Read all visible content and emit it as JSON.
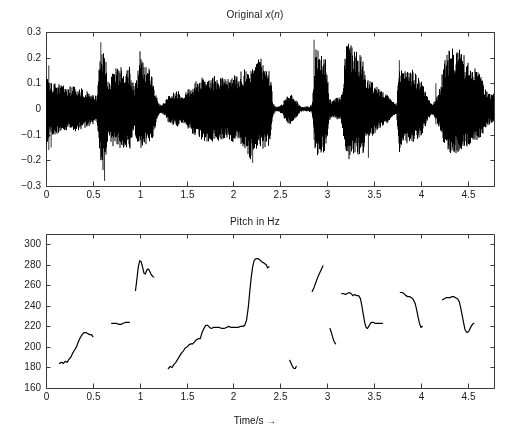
{
  "figure": {
    "width": 510,
    "height": 435,
    "background": "#ffffff",
    "line_color": "#000000",
    "axis_color": "#3a3a3a",
    "font_size_px": 10
  },
  "top_panel": {
    "title": "Original x(n)",
    "title_parts": {
      "prefix": "Original ",
      "italic_x": "x",
      "paren_open": "(",
      "italic_n": "n",
      "paren_close": ")"
    },
    "plot_box": {
      "left": 46,
      "top": 32,
      "right": 494,
      "bottom": 186
    },
    "ylabel": "",
    "xlabel": ""
  },
  "bottom_panel": {
    "title": "Pitch in Hz",
    "xlabel": "Time/s →",
    "plot_box": {
      "left": 46,
      "top": 234,
      "right": 494,
      "bottom": 388
    },
    "ylabel": ""
  },
  "chart_data": [
    {
      "type": "area",
      "title": "Original x(n)",
      "xlabel": "",
      "ylabel": "",
      "xlim": [
        0,
        4.78
      ],
      "ylim": [
        -0.3,
        0.3
      ],
      "xticks": [
        0,
        0.5,
        1,
        1.5,
        2,
        2.5,
        3,
        3.5,
        4,
        4.5
      ],
      "xticklabels": [
        "0",
        "0.5",
        "1",
        "1.5",
        "2",
        "2.5",
        "3",
        "3.5",
        "4",
        "4.5"
      ],
      "yticks": [
        -0.3,
        -0.2,
        -0.1,
        0,
        0.1,
        0.2,
        0.3
      ],
      "yticklabels": [
        "-0.3",
        "-0.2",
        "-0.1",
        "0",
        "0.1",
        "0.2",
        "0.3"
      ],
      "grid": false,
      "legend": "none",
      "description": "Speech waveform amplitude vs time, plotted as dense oscillation filled between positive and negative envelope.",
      "envelope": {
        "comment": "Piecewise envelope of |x(n)| sampled at time t (s); pos = upper bound, neg = lower bound.",
        "t": [
          0.0,
          0.02,
          0.04,
          0.06,
          0.1,
          0.15,
          0.2,
          0.26,
          0.32,
          0.38,
          0.44,
          0.5,
          0.54,
          0.56,
          0.58,
          0.6,
          0.62,
          0.64,
          0.66,
          0.68,
          0.7,
          0.74,
          0.78,
          0.82,
          0.86,
          0.9,
          0.94,
          0.97,
          1.0,
          1.03,
          1.06,
          1.1,
          1.14,
          1.18,
          1.21,
          1.24,
          1.27,
          1.3,
          1.34,
          1.38,
          1.42,
          1.46,
          1.5,
          1.55,
          1.6,
          1.65,
          1.7,
          1.75,
          1.8,
          1.85,
          1.9,
          1.95,
          2.0,
          2.05,
          2.1,
          2.14,
          2.18,
          2.2,
          2.22,
          2.25,
          2.28,
          2.31,
          2.34,
          2.37,
          2.4,
          2.42,
          2.45,
          2.48,
          2.52,
          2.56,
          2.6,
          2.64,
          2.68,
          2.72,
          2.76,
          2.8,
          2.84,
          2.86,
          2.88,
          2.9,
          2.93,
          2.96,
          2.99,
          3.02,
          3.05,
          3.08,
          3.11,
          3.14,
          3.17,
          3.2,
          3.23,
          3.26,
          3.29,
          3.32,
          3.35,
          3.38,
          3.41,
          3.44,
          3.47,
          3.5,
          3.54,
          3.58,
          3.62,
          3.66,
          3.7,
          3.74,
          3.77,
          3.8,
          3.84,
          3.88,
          3.92,
          3.96,
          4.0,
          4.04,
          4.08,
          4.12,
          4.16,
          4.2,
          4.24,
          4.28,
          4.32,
          4.36,
          4.4,
          4.44,
          4.48,
          4.52,
          4.56,
          4.6,
          4.64,
          4.68,
          4.72,
          4.76
        ],
        "pos": [
          0.16,
          0.12,
          0.11,
          0.1,
          0.1,
          0.1,
          0.09,
          0.09,
          0.09,
          0.08,
          0.07,
          0.06,
          0.05,
          0.12,
          0.25,
          0.22,
          0.24,
          0.2,
          0.13,
          0.1,
          0.15,
          0.16,
          0.16,
          0.17,
          0.16,
          0.17,
          0.09,
          0.12,
          0.23,
          0.21,
          0.17,
          0.17,
          0.11,
          0.05,
          0.02,
          0.02,
          0.03,
          0.05,
          0.06,
          0.07,
          0.07,
          0.06,
          0.07,
          0.09,
          0.11,
          0.12,
          0.13,
          0.13,
          0.13,
          0.13,
          0.12,
          0.12,
          0.13,
          0.14,
          0.15,
          0.16,
          0.16,
          0.15,
          0.18,
          0.19,
          0.21,
          0.2,
          0.19,
          0.17,
          0.13,
          0.03,
          0.01,
          0.01,
          0.02,
          0.05,
          0.06,
          0.05,
          0.03,
          0.01,
          0.01,
          0.01,
          0.02,
          0.12,
          0.26,
          0.25,
          0.25,
          0.24,
          0.22,
          0.05,
          0.03,
          0.04,
          0.05,
          0.04,
          0.11,
          0.26,
          0.28,
          0.25,
          0.24,
          0.24,
          0.22,
          0.2,
          0.14,
          0.12,
          0.11,
          0.1,
          0.09,
          0.07,
          0.06,
          0.05,
          0.03,
          0.02,
          0.17,
          0.16,
          0.17,
          0.17,
          0.15,
          0.13,
          0.12,
          0.08,
          0.04,
          0.02,
          0.04,
          0.08,
          0.17,
          0.22,
          0.24,
          0.23,
          0.25,
          0.22,
          0.2,
          0.18,
          0.15,
          0.17,
          0.13,
          0.09,
          0.06,
          0.06
        ],
        "neg": [
          -0.16,
          -0.12,
          -0.11,
          -0.1,
          -0.1,
          -0.1,
          -0.09,
          -0.09,
          -0.09,
          -0.08,
          -0.07,
          -0.06,
          -0.05,
          -0.12,
          -0.21,
          -0.25,
          -0.22,
          -0.2,
          -0.13,
          -0.1,
          -0.15,
          -0.15,
          -0.15,
          -0.16,
          -0.16,
          -0.16,
          -0.09,
          -0.12,
          -0.16,
          -0.15,
          -0.14,
          -0.14,
          -0.11,
          -0.05,
          -0.02,
          -0.02,
          -0.03,
          -0.05,
          -0.06,
          -0.07,
          -0.07,
          -0.06,
          -0.07,
          -0.09,
          -0.11,
          -0.12,
          -0.13,
          -0.13,
          -0.13,
          -0.13,
          -0.12,
          -0.12,
          -0.13,
          -0.14,
          -0.15,
          -0.16,
          -0.21,
          -0.15,
          -0.17,
          -0.16,
          -0.16,
          -0.16,
          -0.16,
          -0.15,
          -0.12,
          -0.03,
          -0.01,
          -0.01,
          -0.02,
          -0.05,
          -0.06,
          -0.05,
          -0.03,
          -0.01,
          -0.01,
          -0.01,
          -0.02,
          -0.12,
          -0.2,
          -0.19,
          -0.18,
          -0.17,
          -0.16,
          -0.05,
          -0.03,
          -0.04,
          -0.05,
          -0.04,
          -0.11,
          -0.18,
          -0.2,
          -0.19,
          -0.19,
          -0.18,
          -0.19,
          -0.2,
          -0.14,
          -0.12,
          -0.11,
          -0.1,
          -0.09,
          -0.07,
          -0.06,
          -0.05,
          -0.03,
          -0.02,
          -0.17,
          -0.14,
          -0.14,
          -0.14,
          -0.13,
          -0.12,
          -0.11,
          -0.08,
          -0.04,
          -0.02,
          -0.04,
          -0.08,
          -0.14,
          -0.17,
          -0.18,
          -0.17,
          -0.18,
          -0.16,
          -0.15,
          -0.14,
          -0.12,
          -0.13,
          -0.11,
          -0.09,
          -0.06,
          -0.06
        ]
      },
      "spikes": [
        {
          "t": 0.03,
          "pos": 0.17,
          "neg": -0.16
        },
        {
          "t": 0.055,
          "pos": 0.05,
          "neg": -0.15
        },
        {
          "t": 0.585,
          "pos": 0.26,
          "neg": -0.2
        },
        {
          "t": 0.625,
          "pos": 0.12,
          "neg": -0.28
        },
        {
          "t": 2.205,
          "pos": 0.1,
          "neg": -0.21
        },
        {
          "t": 2.86,
          "pos": 0.27,
          "neg": -0.12
        },
        {
          "t": 3.44,
          "pos": 0.08,
          "neg": -0.19
        },
        {
          "t": 3.77,
          "pos": 0.19,
          "neg": -0.08
        },
        {
          "t": 4.16,
          "pos": 0.1,
          "neg": -0.06
        }
      ]
    },
    {
      "type": "line",
      "title": "Pitch in Hz",
      "xlabel": "Time/s →",
      "ylabel": "",
      "xlim": [
        0,
        4.78
      ],
      "ylim": [
        160,
        310
      ],
      "xticks": [
        0,
        0.5,
        1,
        1.5,
        2,
        2.5,
        3,
        3.5,
        4,
        4.5
      ],
      "xticklabels": [
        "0",
        "0.5",
        "1",
        "1.5",
        "2",
        "2.5",
        "3",
        "3.5",
        "4",
        "4.5"
      ],
      "yticks": [
        160,
        180,
        200,
        220,
        240,
        260,
        280,
        300
      ],
      "yticklabels": [
        "160",
        "180",
        "200",
        "220",
        "240",
        "260",
        "280",
        "300"
      ],
      "grid": false,
      "legend": "none",
      "description": "Estimated fundamental frequency (pitch) contour in Hz; drawn as disconnected voiced segments.",
      "segments": [
        {
          "name": "segment-1",
          "t": [
            0.145,
            0.165,
            0.185,
            0.205,
            0.225,
            0.245,
            0.265,
            0.285,
            0.305,
            0.325,
            0.345,
            0.365,
            0.385,
            0.405,
            0.425,
            0.445,
            0.465,
            0.485,
            0.5
          ],
          "hz": [
            184,
            185,
            184,
            186,
            185,
            188,
            190,
            194,
            197,
            200,
            205,
            209,
            212,
            214,
            214,
            213,
            212,
            212,
            210
          ]
        },
        {
          "name": "segment-2",
          "t": [
            0.7,
            0.725,
            0.75,
            0.775,
            0.8,
            0.825,
            0.85,
            0.875,
            0.89
          ],
          "hz": [
            223,
            223,
            223,
            222,
            222,
            223,
            224,
            224,
            224
          ]
        },
        {
          "name": "segment-3",
          "t": [
            0.955,
            0.97,
            0.985,
            1.0,
            1.015,
            1.03,
            1.045,
            1.06,
            1.075,
            1.09,
            1.105,
            1.12,
            1.135,
            1.15
          ],
          "hz": [
            255,
            266,
            278,
            284,
            283,
            278,
            272,
            271,
            275,
            276,
            274,
            271,
            269,
            268
          ]
        },
        {
          "name": "segment-4",
          "t": [
            1.305,
            1.325,
            1.345,
            1.365,
            1.385,
            1.405,
            1.425,
            1.445,
            1.465,
            1.485,
            1.505,
            1.525,
            1.545,
            1.565,
            1.585,
            1.605,
            1.625,
            1.645,
            1.665,
            1.685,
            1.705,
            1.725,
            1.745,
            1.765,
            1.785,
            1.805,
            1.825,
            1.85,
            1.875,
            1.9,
            1.925,
            1.95,
            1.975,
            2.0,
            2.025,
            2.05,
            2.075,
            2.1,
            2.12,
            2.14,
            2.16,
            2.175,
            2.19,
            2.205,
            2.22,
            2.24,
            2.26,
            2.28,
            2.3,
            2.32,
            2.335,
            2.35,
            2.365,
            2.38
          ],
          "hz": [
            179,
            181,
            180,
            183,
            185,
            188,
            191,
            194,
            196,
            199,
            200,
            202,
            203,
            203,
            205,
            207,
            208,
            208,
            214,
            218,
            221,
            221,
            219,
            218,
            219,
            219,
            219,
            219,
            218,
            218,
            219,
            220,
            219,
            219,
            219,
            219,
            220,
            220,
            221,
            226,
            240,
            255,
            268,
            278,
            284,
            286,
            286,
            285,
            283,
            282,
            281,
            280,
            277,
            278
          ]
        },
        {
          "name": "segment-5",
          "t": [
            2.6,
            2.615,
            2.63,
            2.645,
            2.66,
            2.67
          ],
          "hz": [
            187,
            184,
            181,
            179,
            179,
            181
          ]
        },
        {
          "name": "segment-6",
          "t": [
            2.84,
            2.86,
            2.88,
            2.9,
            2.92,
            2.94,
            2.955
          ],
          "hz": [
            254,
            258,
            263,
            268,
            272,
            276,
            279
          ]
        },
        {
          "name": "segment-7",
          "t": [
            3.03,
            3.045,
            3.06,
            3.075,
            3.09
          ],
          "hz": [
            218,
            214,
            209,
            205,
            203
          ]
        },
        {
          "name": "segment-8",
          "t": [
            3.155,
            3.175,
            3.195,
            3.215,
            3.235,
            3.255,
            3.275,
            3.295,
            3.315,
            3.335,
            3.355,
            3.37,
            3.385,
            3.4,
            3.415,
            3.43,
            3.45,
            3.47,
            3.49,
            3.51,
            3.53,
            3.55,
            3.57,
            3.59
          ],
          "hz": [
            252,
            252,
            251,
            252,
            253,
            252,
            250,
            251,
            250,
            250,
            247,
            240,
            232,
            224,
            219,
            218,
            221,
            224,
            224,
            223,
            223,
            223,
            223,
            223
          ]
        },
        {
          "name": "segment-9",
          "t": [
            3.78,
            3.8,
            3.82,
            3.84,
            3.86,
            3.88,
            3.9,
            3.92,
            3.94,
            3.955,
            3.97,
            3.985,
            4.0,
            4.015
          ],
          "hz": [
            253,
            253,
            252,
            250,
            249,
            249,
            248,
            246,
            242,
            236,
            229,
            223,
            219,
            220
          ]
        },
        {
          "name": "segment-10",
          "t": [
            4.23,
            4.25,
            4.27,
            4.29,
            4.31,
            4.33,
            4.35,
            4.37,
            4.39,
            4.41,
            4.425,
            4.44,
            4.455,
            4.47,
            4.49,
            4.51,
            4.53,
            4.55,
            4.565
          ],
          "hz": [
            246,
            247,
            248,
            248,
            248,
            249,
            249,
            248,
            247,
            244,
            238,
            231,
            224,
            217,
            214,
            215,
            219,
            222,
            223
          ]
        }
      ]
    }
  ]
}
